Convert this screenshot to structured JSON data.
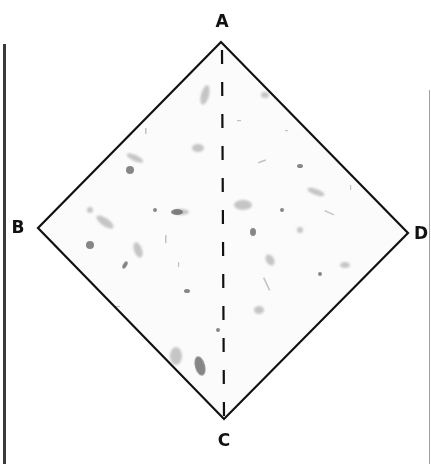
{
  "diagram": {
    "shape": "square-rotated-45",
    "fill_texture": "speckled paper",
    "colors": {
      "background": "#ffffff",
      "outline": "#111111",
      "fold_line": "#111111",
      "fleck": "#7a7a7a",
      "left_rule": "#3a3a3a",
      "right_rule": "#9a9a9a"
    },
    "vertices": [
      {
        "id": "A",
        "label": "A",
        "position": "top",
        "x": 221,
        "y": 42,
        "label_x": 222,
        "label_y": 21
      },
      {
        "id": "B",
        "label": "B",
        "position": "left",
        "x": 38,
        "y": 228,
        "label_x": 18,
        "label_y": 227
      },
      {
        "id": "C",
        "label": "C",
        "position": "bottom",
        "x": 224,
        "y": 419,
        "label_x": 224,
        "label_y": 440
      },
      {
        "id": "D",
        "label": "D",
        "position": "right",
        "x": 408,
        "y": 233,
        "label_x": 421,
        "label_y": 233
      }
    ],
    "fold_line": {
      "from": "A",
      "to": "C",
      "style": "dashed"
    }
  }
}
